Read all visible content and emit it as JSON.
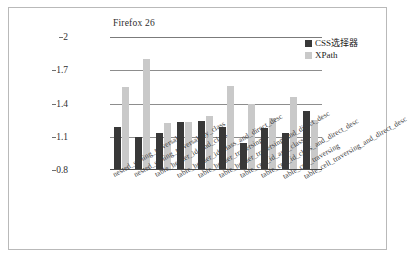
{
  "chart_data": {
    "type": "bar",
    "title": "Firefox 26",
    "xlabel": "",
    "ylabel": "",
    "ylim": [
      0.8,
      2
    ],
    "yticks": [
      "0.8",
      "1.1",
      "1.4",
      "1.7",
      "2"
    ],
    "grid": true,
    "legend_position": "top-right",
    "categories": [
      "nested_sibling_traversal",
      "nested_sibling_traversal_by_class",
      "table_header_id_and_class",
      "table_header_id_class_and_direct_desc",
      "table_header_traversing",
      "table_header_traversing_and_direct_desc",
      "table_cell_id_and_class",
      "table_cell_id_class_and_direct_desc",
      "table_cell_traversing",
      "table_cell_traversing_and_direct_desc"
    ],
    "series": [
      {
        "name": "CSS选择器",
        "color": "#383838",
        "values": [
          1.19,
          1.1,
          1.13,
          1.23,
          1.24,
          1.19,
          1.04,
          1.18,
          1.13,
          1.33
        ]
      },
      {
        "name": "XPath",
        "color": "#c9c9c9",
        "values": [
          1.55,
          1.8,
          1.22,
          1.23,
          1.29,
          1.56,
          1.4,
          1.27,
          1.46,
          1.25
        ]
      }
    ]
  },
  "legend": {
    "items": [
      {
        "label": "CSS选择器",
        "color": "#383838"
      },
      {
        "label": "XPath",
        "color": "#c9c9c9"
      }
    ]
  }
}
